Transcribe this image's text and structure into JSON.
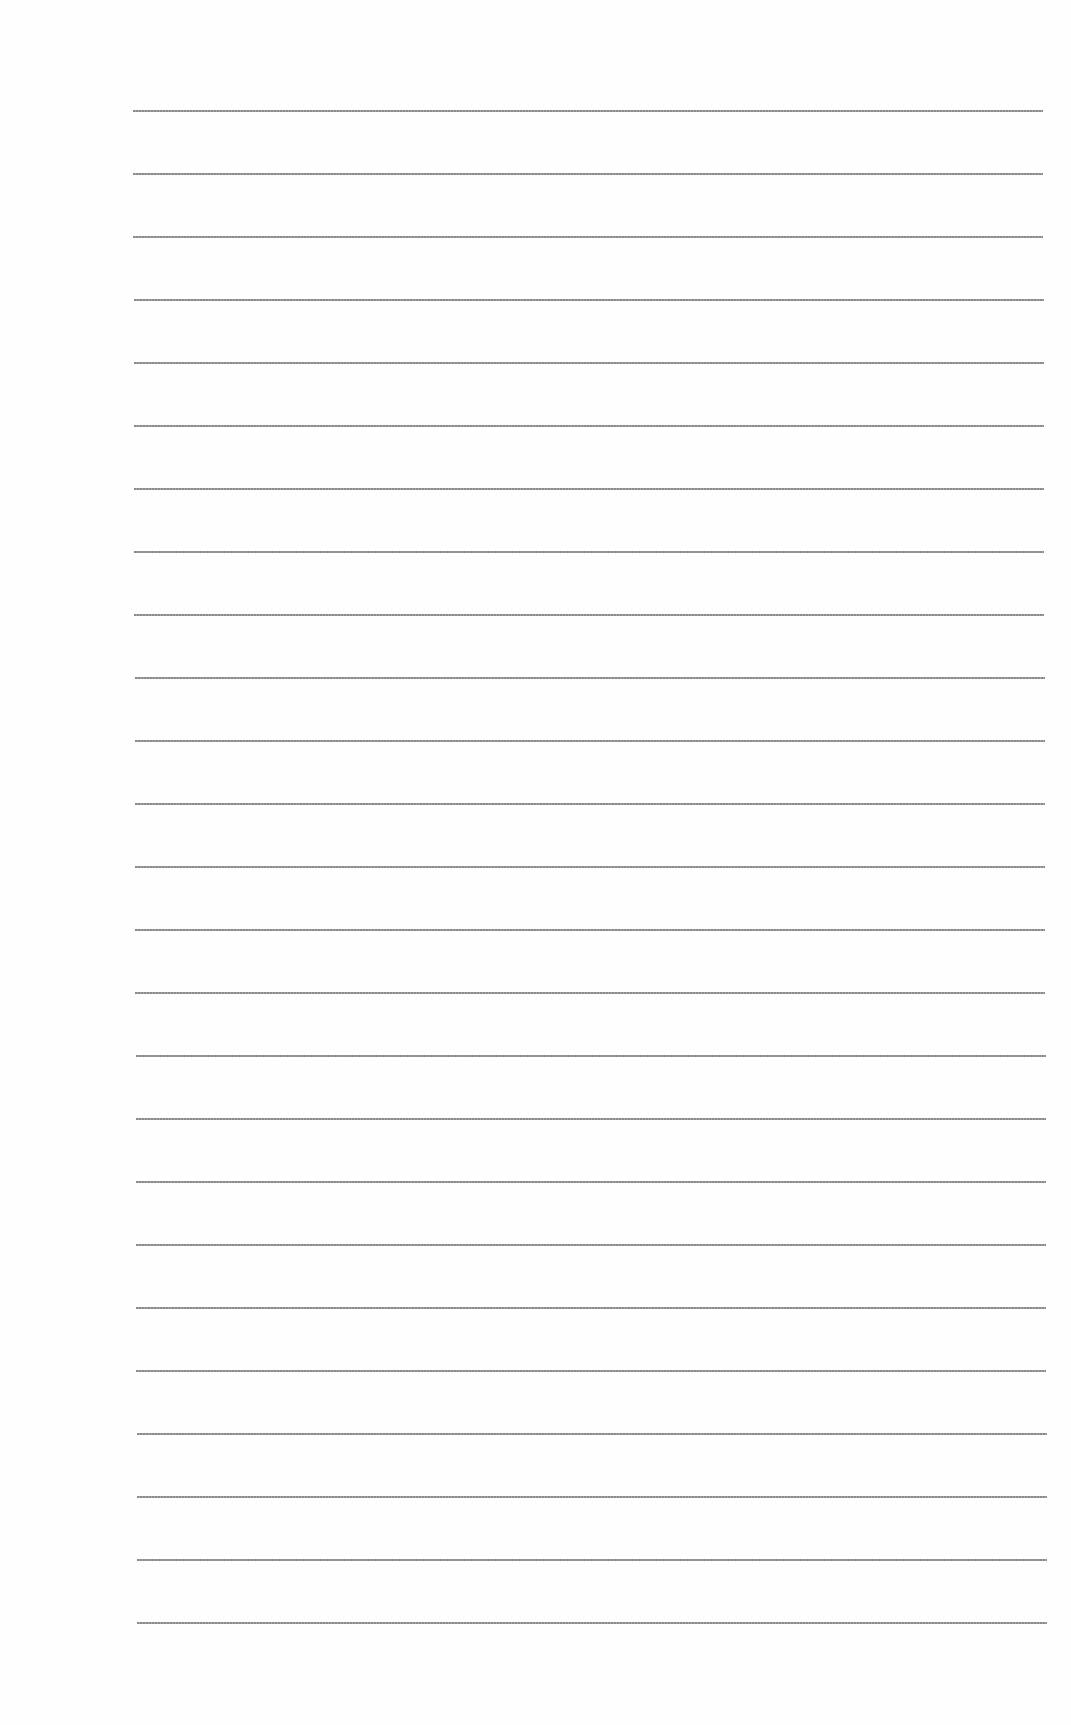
{
  "document": {
    "type": "ruled-paper",
    "line_count": 25,
    "first_line_y": 110,
    "line_spacing": 63,
    "line_left": 133,
    "line_right": 1043,
    "line_color": "#848484",
    "background_color": "#fefefe"
  }
}
